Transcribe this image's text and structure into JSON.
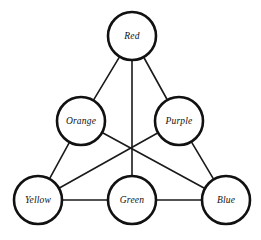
{
  "diagram": {
    "type": "undirected-graph",
    "title": "",
    "background_color": "#ffffff",
    "node_fill_color": "#ffffff",
    "node_stroke_color": "#111111",
    "edge_color": "#1a1a1a",
    "label_color": "#111111",
    "node_radius": 24,
    "nodes": [
      {
        "id": "red",
        "label": "Red",
        "cx": 132,
        "cy": 36
      },
      {
        "id": "orange",
        "label": "Orange",
        "cx": 81,
        "cy": 121
      },
      {
        "id": "purple",
        "label": "Purple",
        "cx": 179,
        "cy": 121
      },
      {
        "id": "yellow",
        "label": "Yellow",
        "cx": 38,
        "cy": 200
      },
      {
        "id": "green",
        "label": "Green",
        "cx": 132,
        "cy": 200
      },
      {
        "id": "blue",
        "label": "Blue",
        "cx": 226,
        "cy": 200
      }
    ],
    "edges": [
      {
        "id": "red-orange",
        "from": "red",
        "to": "orange"
      },
      {
        "id": "red-purple",
        "from": "red",
        "to": "purple"
      },
      {
        "id": "red-green",
        "from": "red",
        "to": "green"
      },
      {
        "id": "orange-yellow",
        "from": "orange",
        "to": "yellow"
      },
      {
        "id": "orange-blue",
        "from": "orange",
        "to": "blue"
      },
      {
        "id": "purple-yellow",
        "from": "purple",
        "to": "yellow"
      },
      {
        "id": "purple-blue",
        "from": "purple",
        "to": "blue"
      },
      {
        "id": "yellow-green",
        "from": "yellow",
        "to": "green"
      },
      {
        "id": "green-blue",
        "from": "green",
        "to": "blue"
      }
    ]
  }
}
